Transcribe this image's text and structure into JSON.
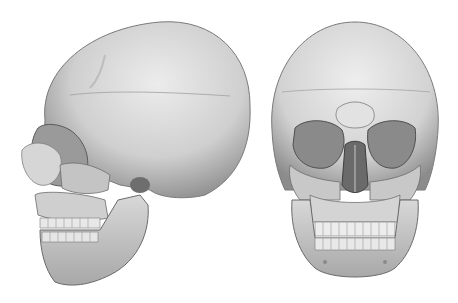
{
  "image": {
    "subject": "3D rendered human skull",
    "views": [
      {
        "name": "lateral-view",
        "orientation": "left profile"
      },
      {
        "name": "frontal-view",
        "orientation": "anterior"
      }
    ],
    "colors": {
      "background": "#ffffff",
      "bone_light": "#e4e4e4",
      "bone_mid": "#b8b8b8",
      "bone_dark": "#6e6e6e",
      "shadow": "#3c3c3c"
    }
  }
}
